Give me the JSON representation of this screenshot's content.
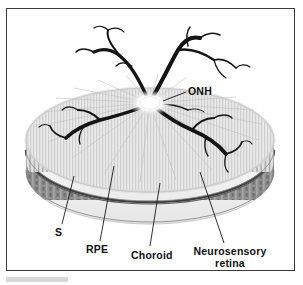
{
  "labels": {
    "onh": "ONH",
    "sclera": "S",
    "rpe": "RPE",
    "choroid": "Choroid",
    "retina_line1": "Neurosensory",
    "retina_line2": "retina"
  },
  "colors": {
    "frame": "#3a3a3a",
    "background": "#ffffff",
    "retina_surface": "#e4e4e4",
    "retina_stripe": "#c9c9c9",
    "retina_band": "#dedede",
    "rpe_band": "#4a4a4a",
    "choroid_band": "#9a9a9a",
    "sclera_band": "#f0f0f0",
    "vessel": "#141414",
    "onh_center": "#ffffff",
    "leader": "#1a1a1a"
  },
  "structure": {
    "layers": [
      {
        "name": "neurosensory retina",
        "order": 1,
        "tone": "light striped"
      },
      {
        "name": "retinal pigment epithelium",
        "order": 2,
        "tone": "dark line"
      },
      {
        "name": "choroid",
        "order": 3,
        "tone": "mid gray mottled"
      },
      {
        "name": "sclera",
        "order": 4,
        "tone": "pale outer"
      }
    ],
    "onh_position": {
      "x": 150,
      "y": 103
    },
    "vessel_count": 6
  }
}
